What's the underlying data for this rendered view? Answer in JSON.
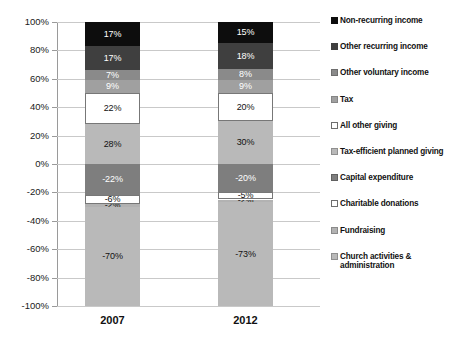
{
  "chart_data": {
    "type": "bar",
    "subtype": "stacked-bar-diverging",
    "title": "",
    "subtitle": "",
    "xlabel": "",
    "ylabel": "",
    "categories": [
      "2007",
      "2012"
    ],
    "ylim": [
      -100,
      100
    ],
    "ytick_labels": [
      "100%",
      "80%",
      "60%",
      "40%",
      "20%",
      "0%",
      "-20%",
      "-40%",
      "-60%",
      "-80%",
      "-100%"
    ],
    "ytick_values": [
      100,
      80,
      60,
      40,
      20,
      0,
      -20,
      -40,
      -60,
      -80,
      -100
    ],
    "grid": true,
    "legend_position": "right",
    "series": [
      {
        "name": "Non-recurring income",
        "color": "#0d0d0d",
        "text_color": "#ffffff",
        "values": [
          17,
          15
        ],
        "labels": [
          "17%",
          "15%"
        ]
      },
      {
        "name": "Other recurring income",
        "color": "#3f3f3f",
        "text_color": "#ffffff",
        "values": [
          17,
          18
        ],
        "labels": [
          "17%",
          "18%"
        ]
      },
      {
        "name": "Other voluntary income",
        "color": "#8a8a8a",
        "text_color": "#ffffff",
        "values": [
          7,
          8
        ],
        "labels": [
          "7%",
          "8%"
        ]
      },
      {
        "name": "Tax",
        "color": "#a0a0a0",
        "text_color": "#ffffff",
        "values": [
          9,
          9
        ],
        "labels": [
          "9%",
          "9%"
        ]
      },
      {
        "name": "All other giving",
        "color": "#ffffff",
        "text_color": "#111111",
        "values": [
          22,
          20
        ],
        "labels": [
          "22%",
          "20%"
        ]
      },
      {
        "name": "Tax-efficient planned giving",
        "color": "#b9b9b9",
        "text_color": "#111111",
        "values": [
          28,
          30
        ],
        "labels": [
          "28%",
          "30%"
        ]
      },
      {
        "name": "Capital expenditure",
        "color": "#7e7e7e",
        "text_color": "#ffffff",
        "values": [
          -22,
          -20
        ],
        "labels": [
          "-22%",
          "-20%"
        ]
      },
      {
        "name": "Charitable donations",
        "color": "#ffffff",
        "text_color": "#111111",
        "values": [
          -6,
          -5
        ],
        "labels": [
          "-6%",
          "-5%"
        ]
      },
      {
        "name": "Fundraising",
        "color": "#b2b2b2",
        "text_color": "#111111",
        "values": [
          -2,
          -2
        ],
        "labels": [
          "-2%",
          "-2%"
        ]
      },
      {
        "name": "Church activities & administration",
        "color": "#b9b9b9",
        "text_color": "#111111",
        "values": [
          -70,
          -73
        ],
        "labels": [
          "-70%",
          "-73%"
        ]
      }
    ]
  },
  "axis": {
    "y_ticks": [
      {
        "label": "100%",
        "value": 100
      },
      {
        "label": "80%",
        "value": 80
      },
      {
        "label": "60%",
        "value": 60
      },
      {
        "label": "40%",
        "value": 40
      },
      {
        "label": "20%",
        "value": 20
      },
      {
        "label": "0%",
        "value": 0
      },
      {
        "label": "-20%",
        "value": -20
      },
      {
        "label": "-40%",
        "value": -40
      },
      {
        "label": "-60%",
        "value": -60
      },
      {
        "label": "-80%",
        "value": -80
      },
      {
        "label": "-100%",
        "value": -100
      }
    ]
  },
  "legend": {
    "items": [
      {
        "label": "Non-recurring income",
        "color": "#0d0d0d",
        "border": "#0d0d0d"
      },
      {
        "label": "Other recurring income",
        "color": "#3f3f3f",
        "border": "#3f3f3f"
      },
      {
        "label": "Other voluntary income",
        "color": "#8a8a8a",
        "border": "#6e6e6e"
      },
      {
        "label": "Tax",
        "color": "#a0a0a0",
        "border": "#858585"
      },
      {
        "label": "All other giving",
        "color": "#ffffff",
        "border": "#6e6e6e"
      },
      {
        "label": "Tax-efficient planned giving",
        "color": "#b9b9b9",
        "border": "#8f8f8f"
      },
      {
        "label": "Capital expenditure",
        "color": "#7e7e7e",
        "border": "#606060"
      },
      {
        "label": "Charitable donations",
        "color": "#ffffff",
        "border": "#6e6e6e"
      },
      {
        "label": "Fundraising",
        "color": "#b2b2b2",
        "border": "#8a8a8a"
      },
      {
        "label": "Church activities & administration",
        "color": "#b9b9b9",
        "border": "#8f8f8f"
      }
    ]
  },
  "categories": [
    {
      "label": "2007"
    },
    {
      "label": "2012"
    }
  ]
}
